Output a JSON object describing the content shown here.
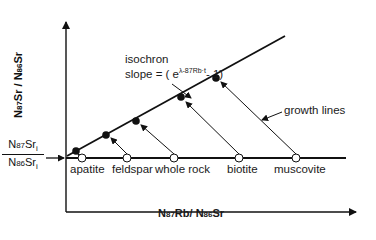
{
  "diagram": {
    "y_axis": {
      "label_parts": [
        "N",
        "87",
        "Sr",
        " / ",
        "N",
        "86",
        "Sr"
      ]
    },
    "x_axis": {
      "label_parts": [
        "N",
        "87",
        "Rb",
        "/ ",
        "N",
        "86",
        "Sr"
      ]
    },
    "initial_ratio": {
      "numerator_parts": [
        "N",
        "87",
        "Sr",
        "i"
      ],
      "denominator_parts": [
        "N",
        "86",
        "Sr",
        "i"
      ]
    },
    "isochron": {
      "label": "isochron",
      "slope_prefix": "slope = ( e",
      "slope_exponent": "λ-87Rb·t",
      "slope_suffix": "- 1)"
    },
    "growth_lines_label": "growth lines",
    "minerals": [
      {
        "name": "apatite"
      },
      {
        "name": "feldspar"
      },
      {
        "name": "whole rock"
      },
      {
        "name": "biotite"
      },
      {
        "name": "muscovite"
      }
    ],
    "legend_markers": {
      "open_circle": "initial composition",
      "filled_circle": "present composition"
    }
  }
}
